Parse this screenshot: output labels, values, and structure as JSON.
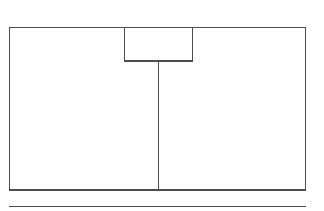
{
  "diagram": {
    "title": "Plan view line drawing",
    "type": "line-drawing",
    "background_color": "#ffffff",
    "stroke_color": "#4d4d4d",
    "fill_color": "#fefefe",
    "canvas": {
      "width": 324,
      "height": 211
    },
    "shapes": [
      {
        "name": "main-rectangle",
        "kind": "rectangle",
        "x": 9,
        "y": 27,
        "width": 297,
        "height": 163
      },
      {
        "name": "top-alcove-rectangle",
        "kind": "rectangle",
        "x": 124,
        "y": 27,
        "width": 69,
        "height": 34
      },
      {
        "name": "vertical-divider-line",
        "kind": "line",
        "x1": 158,
        "y1": 61,
        "x2": 158,
        "y2": 190
      },
      {
        "name": "bottom-horizontal-line",
        "kind": "line",
        "x1": 9,
        "y1": 206,
        "x2": 306,
        "y2": 206
      }
    ],
    "labels": []
  }
}
